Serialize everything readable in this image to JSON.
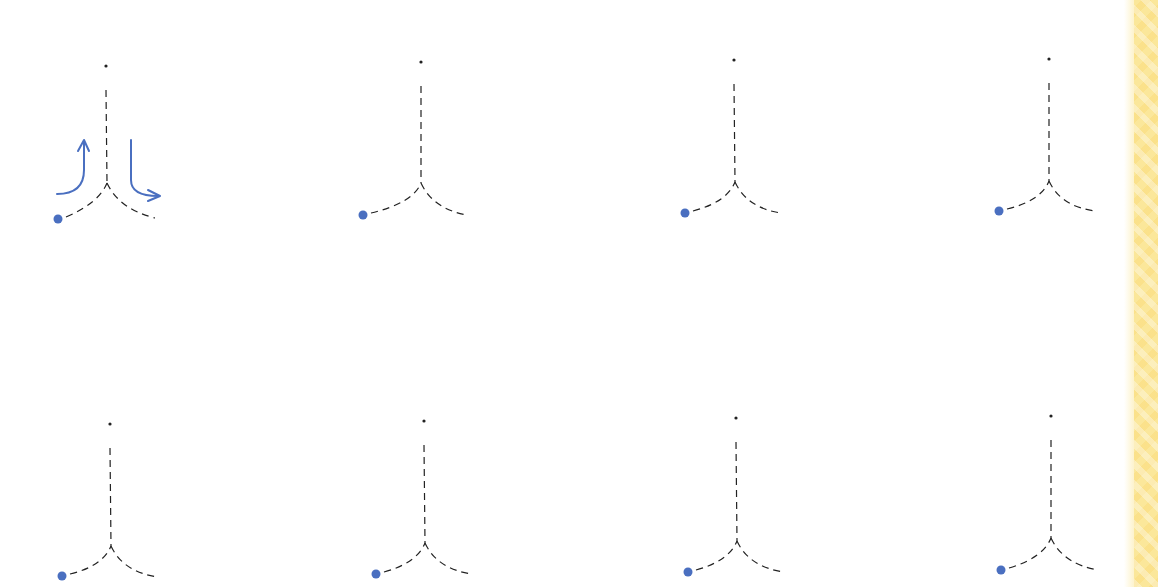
{
  "worksheet": {
    "title": "",
    "colors": {
      "ink": "#222222",
      "start_dot": "#4a6fc0",
      "arrow": "#4a6fc0",
      "border": "#fbe79a",
      "background": "#ffffff"
    },
    "figures": [
      {
        "id": 1,
        "row": 1,
        "col": 1,
        "top_dot": [
          106,
          66
        ],
        "junction": [
          107,
          183
        ],
        "start_dot": [
          58,
          219
        ],
        "end": [
          155,
          218
        ],
        "has_arrows": true
      },
      {
        "id": 2,
        "row": 1,
        "col": 2,
        "top_dot": [
          421,
          62
        ],
        "junction": [
          421,
          183
        ],
        "start_dot": [
          363,
          215
        ],
        "end": [
          467,
          215
        ],
        "has_arrows": false
      },
      {
        "id": 3,
        "row": 1,
        "col": 3,
        "top_dot": [
          734,
          60
        ],
        "junction": [
          735,
          182
        ],
        "start_dot": [
          685,
          213
        ],
        "end": [
          781,
          213
        ],
        "has_arrows": false
      },
      {
        "id": 4,
        "row": 1,
        "col": 4,
        "top_dot": [
          1049,
          59
        ],
        "junction": [
          1049,
          181
        ],
        "start_dot": [
          999,
          211
        ],
        "end": [
          1096,
          211
        ],
        "has_arrows": false
      },
      {
        "id": 5,
        "row": 2,
        "col": 1,
        "top_dot": [
          110,
          424
        ],
        "junction": [
          111,
          546
        ],
        "start_dot": [
          62,
          576
        ],
        "end": [
          158,
          577
        ],
        "has_arrows": false
      },
      {
        "id": 6,
        "row": 2,
        "col": 2,
        "top_dot": [
          424,
          421
        ],
        "junction": [
          425,
          543
        ],
        "start_dot": [
          376,
          574
        ],
        "end": [
          472,
          574
        ],
        "has_arrows": false
      },
      {
        "id": 7,
        "row": 2,
        "col": 3,
        "top_dot": [
          736,
          418
        ],
        "junction": [
          737,
          541
        ],
        "start_dot": [
          688,
          572
        ],
        "end": [
          784,
          572
        ],
        "has_arrows": false
      },
      {
        "id": 8,
        "row": 2,
        "col": 4,
        "top_dot": [
          1051,
          416
        ],
        "junction": [
          1051,
          538
        ],
        "start_dot": [
          1001,
          570
        ],
        "end": [
          1098,
          570
        ],
        "has_arrows": false
      }
    ],
    "arrows": {
      "up_arrow": {
        "path": "M57 194 Q84 194 84 170 L84 141",
        "head": "M78 151 L84 140 L89 151"
      },
      "down_arrow": {
        "path": "M131 140 L131 180 Q131 196 158 196",
        "head": "M148 190 L160 196 L148 201"
      }
    }
  }
}
